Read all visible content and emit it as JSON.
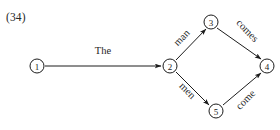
{
  "figure": {
    "example_number": "(34)",
    "type": "finite-state transition network",
    "background_color": "#ffffff",
    "ink_color": "#1c1c1c"
  },
  "nodes": [
    {
      "id": "1",
      "label": "1",
      "cx": 37,
      "cy": 66,
      "r": 7
    },
    {
      "id": "2",
      "label": "2",
      "cx": 170,
      "cy": 66,
      "r": 7
    },
    {
      "id": "3",
      "label": "3",
      "cx": 211,
      "cy": 22,
      "r": 7
    },
    {
      "id": "4",
      "label": "4",
      "cx": 267,
      "cy": 66,
      "r": 7
    },
    {
      "id": "5",
      "label": "5",
      "cx": 216,
      "cy": 111,
      "r": 7
    }
  ],
  "edges": [
    {
      "id": "e1",
      "from": "1",
      "to": "2",
      "label": "The",
      "x1": 45,
      "y1": 66,
      "x2": 161,
      "y2": 66,
      "label_x": 103,
      "label_y": 54,
      "label_rotation": 0
    },
    {
      "id": "e2",
      "from": "2",
      "to": "3",
      "label": "man",
      "x1": 176,
      "y1": 60,
      "x2": 206,
      "y2": 29,
      "label_x": 184,
      "label_y": 40,
      "label_rotation": -46
    },
    {
      "id": "e3",
      "from": "3",
      "to": "4",
      "label": "comes",
      "x1": 217,
      "y1": 28,
      "x2": 261,
      "y2": 59,
      "label_x": 245,
      "label_y": 33,
      "label_rotation": 46
    },
    {
      "id": "e4",
      "from": "2",
      "to": "5",
      "label": "men",
      "x1": 176,
      "y1": 72,
      "x2": 209,
      "y2": 105,
      "label_x": 185,
      "label_y": 93,
      "label_rotation": 46
    },
    {
      "id": "e5",
      "from": "5",
      "to": "4",
      "label": "come",
      "x1": 223,
      "y1": 105,
      "x2": 261,
      "y2": 73,
      "label_x": 248,
      "label_y": 102,
      "label_rotation": -46
    }
  ]
}
